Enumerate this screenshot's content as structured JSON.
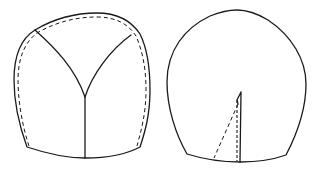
{
  "figure": {
    "pieces": [
      {
        "name": "left-piece",
        "features": [
          "outer outline",
          "dashed seam allowance",
          "Y-shaped seam lines",
          "center vertical seam"
        ]
      },
      {
        "name": "right-piece",
        "features": [
          "outer outline",
          "dart with dashed fold lines"
        ]
      }
    ],
    "colors": {
      "line": "#1a1a1a",
      "background": "#ffffff"
    }
  }
}
